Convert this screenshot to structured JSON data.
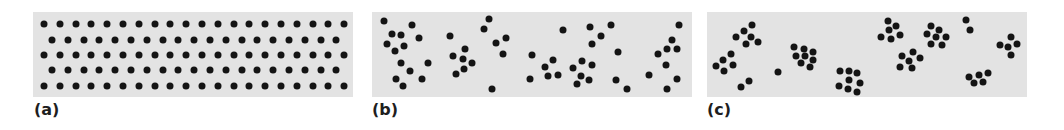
{
  "figure": {
    "panels": [
      {
        "id": "a",
        "label": "(a)",
        "description": "uniform",
        "box": {
          "x": 33,
          "w": 320
        },
        "grid": {
          "rows": [
            {
              "y": 24,
              "x0": 44,
              "count": 20
            },
            {
              "y": 40,
              "x0": 52,
              "count": 19
            },
            {
              "y": 55,
              "x0": 44,
              "count": 20
            },
            {
              "y": 70,
              "x0": 52,
              "count": 19
            },
            {
              "y": 86,
              "x0": 44,
              "count": 20
            }
          ],
          "spacing": 15.8
        }
      },
      {
        "id": "b",
        "label": "(b)",
        "description": "random",
        "box": {
          "x": 372,
          "w": 320
        },
        "dots": [
          [
            384,
            21
          ],
          [
            412,
            25
          ],
          [
            392,
            34
          ],
          [
            401,
            35
          ],
          [
            419,
            38
          ],
          [
            387,
            44
          ],
          [
            404,
            46
          ],
          [
            395,
            51
          ],
          [
            401,
            63
          ],
          [
            428,
            63
          ],
          [
            410,
            71
          ],
          [
            396,
            79
          ],
          [
            422,
            79
          ],
          [
            403,
            86
          ],
          [
            450,
            36
          ],
          [
            465,
            49
          ],
          [
            453,
            56
          ],
          [
            463,
            59
          ],
          [
            472,
            63
          ],
          [
            464,
            69
          ],
          [
            456,
            74
          ],
          [
            489,
            19
          ],
          [
            484,
            29
          ],
          [
            506,
            38
          ],
          [
            496,
            43
          ],
          [
            503,
            54
          ],
          [
            492,
            89
          ],
          [
            532,
            55
          ],
          [
            545,
            67
          ],
          [
            530,
            79
          ],
          [
            548,
            76
          ],
          [
            563,
            30
          ],
          [
            590,
            27
          ],
          [
            611,
            25
          ],
          [
            601,
            36
          ],
          [
            592,
            44
          ],
          [
            618,
            52
          ],
          [
            553,
            60
          ],
          [
            582,
            61
          ],
          [
            592,
            65
          ],
          [
            573,
            68
          ],
          [
            558,
            75
          ],
          [
            581,
            76
          ],
          [
            589,
            80
          ],
          [
            577,
            84
          ],
          [
            616,
            80
          ],
          [
            627,
            89
          ],
          [
            679,
            25
          ],
          [
            672,
            40
          ],
          [
            667,
            49
          ],
          [
            677,
            49
          ],
          [
            658,
            54
          ],
          [
            666,
            65
          ],
          [
            649,
            75
          ],
          [
            677,
            79
          ],
          [
            667,
            89
          ]
        ]
      },
      {
        "id": "c",
        "label": "(c)",
        "description": "clumped",
        "box": {
          "x": 707,
          "w": 320
        },
        "dots": [
          [
            752,
            25
          ],
          [
            744,
            31
          ],
          [
            736,
            37
          ],
          [
            751,
            37
          ],
          [
            758,
            42
          ],
          [
            746,
            44
          ],
          [
            731,
            54
          ],
          [
            723,
            60
          ],
          [
            716,
            66
          ],
          [
            733,
            65
          ],
          [
            724,
            71
          ],
          [
            749,
            81
          ],
          [
            741,
            87
          ],
          [
            778,
            72
          ],
          [
            794,
            47
          ],
          [
            804,
            49
          ],
          [
            813,
            52
          ],
          [
            796,
            56
          ],
          [
            805,
            56
          ],
          [
            813,
            60
          ],
          [
            801,
            63
          ],
          [
            810,
            67
          ],
          [
            840,
            71
          ],
          [
            849,
            71
          ],
          [
            857,
            73
          ],
          [
            849,
            80
          ],
          [
            860,
            83
          ],
          [
            839,
            86
          ],
          [
            848,
            89
          ],
          [
            857,
            92
          ],
          [
            888,
            21
          ],
          [
            896,
            26
          ],
          [
            889,
            30
          ],
          [
            881,
            37
          ],
          [
            891,
            39
          ],
          [
            900,
            35
          ],
          [
            931,
            26
          ],
          [
            939,
            30
          ],
          [
            927,
            34
          ],
          [
            936,
            37
          ],
          [
            946,
            37
          ],
          [
            931,
            44
          ],
          [
            942,
            45
          ],
          [
            913,
            52
          ],
          [
            902,
            56
          ],
          [
            920,
            58
          ],
          [
            909,
            61
          ],
          [
            900,
            67
          ],
          [
            912,
            68
          ],
          [
            966,
            20
          ],
          [
            970,
            30
          ],
          [
            1011,
            37
          ],
          [
            1000,
            45
          ],
          [
            1008,
            47
          ],
          [
            1017,
            44
          ],
          [
            1011,
            55
          ],
          [
            988,
            73
          ],
          [
            979,
            75
          ],
          [
            969,
            77
          ],
          [
            974,
            83
          ],
          [
            983,
            82
          ]
        ]
      }
    ],
    "colors": {
      "panel_bg": "#e3e3e3",
      "dot": "#141414",
      "label": "#1e1e1e"
    }
  }
}
